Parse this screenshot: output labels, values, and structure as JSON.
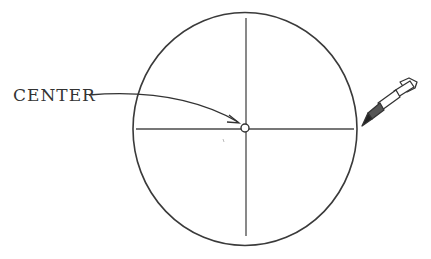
{
  "diagram": {
    "labels": {
      "center": "CENTER"
    },
    "icons": {
      "pen": "pen-icon"
    },
    "colors": {
      "stroke": "#3a3a3a",
      "background": "#ffffff"
    }
  }
}
